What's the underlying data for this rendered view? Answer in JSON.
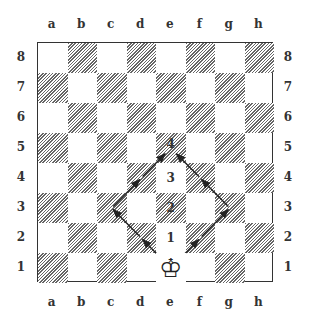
{
  "diagram": {
    "type": "chessboard",
    "files": [
      "a",
      "b",
      "c",
      "d",
      "e",
      "f",
      "g",
      "h"
    ],
    "ranks": [
      "8",
      "7",
      "6",
      "5",
      "4",
      "3",
      "2",
      "1"
    ],
    "pieces": [
      {
        "square": "e1",
        "piece": "white-king",
        "glyph": "♔"
      }
    ],
    "step_labels": [
      {
        "square": "e2",
        "label": "1"
      },
      {
        "square": "e3",
        "label": "2"
      },
      {
        "square": "e4",
        "label": "3"
      },
      {
        "square": "e5",
        "label": "4"
      }
    ],
    "paths": [
      {
        "name": "left-path",
        "squares": [
          "e1",
          "d2",
          "c3",
          "d4",
          "e5"
        ]
      },
      {
        "name": "right-path",
        "squares": [
          "e1",
          "f2",
          "g3",
          "f4",
          "e5"
        ]
      }
    ],
    "colors": {
      "dark_square_hatch": "#666666",
      "light_square": "#ffffff",
      "border": "#333333",
      "arrow": "#222222"
    }
  }
}
